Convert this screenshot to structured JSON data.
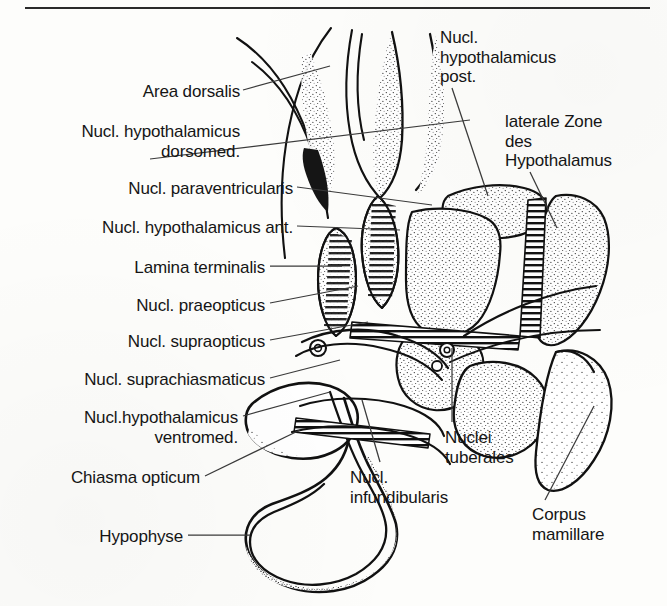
{
  "figure": {
    "title": "Hypothalamus",
    "language": "de",
    "top_rule": true,
    "background_color": "#fdfdfb",
    "ink_color": "#151515"
  },
  "labels": [
    {
      "id": "area-dorsalis",
      "text": "Area dorsalis",
      "lines": [
        "Area dorsalis"
      ],
      "align": "right",
      "x": 10,
      "y": 82,
      "w": 230
    },
    {
      "id": "nucl-hypo-dorsomed",
      "text": "Nucl. hypothalamicus dorsomed.",
      "lines": [
        "Nucl. hypothalamicus",
        "dorsomed."
      ],
      "align": "right",
      "x": 10,
      "y": 122,
      "w": 230
    },
    {
      "id": "nucl-paraventricularis",
      "text": "Nucl. paraventricularis",
      "lines": [
        "Nucl. paraventricularis"
      ],
      "align": "right",
      "x": 10,
      "y": 179,
      "w": 283
    },
    {
      "id": "nucl-hypo-ant",
      "text": "Nucl. hypothalamicus ant.",
      "lines": [
        "Nucl. hypothalamicus ant."
      ],
      "align": "right",
      "x": 10,
      "y": 218,
      "w": 283
    },
    {
      "id": "lamina-terminalis",
      "text": "Lamina terminalis",
      "lines": [
        "Lamina terminalis"
      ],
      "align": "right",
      "x": 10,
      "y": 258,
      "w": 255
    },
    {
      "id": "nucl-praeopticus",
      "text": "Nucl. praeopticus",
      "lines": [
        "Nucl. praeopticus"
      ],
      "align": "right",
      "x": 10,
      "y": 296,
      "w": 255
    },
    {
      "id": "nucl-supraopticus",
      "text": "Nucl. supraopticus",
      "lines": [
        "Nucl. supraopticus"
      ],
      "align": "right",
      "x": 10,
      "y": 332,
      "w": 255
    },
    {
      "id": "nucl-suprachiasmaticus",
      "text": "Nucl. suprachiasmaticus",
      "lines": [
        "Nucl. suprachiasmaticus"
      ],
      "align": "right",
      "x": 10,
      "y": 370,
      "w": 255
    },
    {
      "id": "nucl-hypo-ventromed",
      "text": "Nucl. hypothalamicus ventromed.",
      "lines": [
        "Nucl.hypothalamicus",
        "ventromed."
      ],
      "align": "right",
      "x": 10,
      "y": 408,
      "w": 228
    },
    {
      "id": "chiasma-opticum",
      "text": "Chiasma opticum",
      "lines": [
        "Chiasma opticum"
      ],
      "align": "right",
      "x": 10,
      "y": 468,
      "w": 190
    },
    {
      "id": "hypophyse",
      "text": "Hypophyse",
      "lines": [
        "Hypophyse"
      ],
      "align": "right",
      "x": 10,
      "y": 527,
      "w": 173
    },
    {
      "id": "nucl-hypo-post",
      "text": "Nucl. hypothalamicus post.",
      "lines": [
        "Nucl.",
        "hypothalamicus",
        "post."
      ],
      "align": "left",
      "x": 440,
      "y": 28,
      "w": 200
    },
    {
      "id": "laterale-zone",
      "text": "laterale Zone des Hypothalamus",
      "lines": [
        "laterale Zone",
        "des",
        "Hypothalamus"
      ],
      "align": "left",
      "x": 505,
      "y": 112,
      "w": 160
    },
    {
      "id": "nuclei-tuberales",
      "text": "Nuclei tuberales",
      "lines": [
        "Nuclei",
        "tuberales"
      ],
      "align": "left",
      "x": 445,
      "y": 428,
      "w": 130
    },
    {
      "id": "nucl-infundibularis",
      "text": "Nucl. infundibularis",
      "lines": [
        "Nucl.",
        "infundibularis"
      ],
      "align": "left",
      "x": 350,
      "y": 468,
      "w": 145
    },
    {
      "id": "corpus-mamillare",
      "text": "Corpus mamillare",
      "lines": [
        "Corpus",
        "mamillare"
      ],
      "align": "left",
      "x": 532,
      "y": 505,
      "w": 135
    }
  ],
  "leaders": [
    {
      "id": "leader-area-dorsalis",
      "from": [
        243,
        90
      ],
      "to": [
        330,
        66
      ]
    },
    {
      "id": "leader-nucl-hypo-dorsomed",
      "from": [
        150,
        159
      ],
      "to": [
        470,
        120
      ]
    },
    {
      "id": "leader-nucl-paraventricularis",
      "from": [
        297,
        187
      ],
      "to": [
        432,
        205
      ]
    },
    {
      "id": "leader-nucl-hypo-ant",
      "from": [
        297,
        226
      ],
      "to": [
        400,
        230
      ]
    },
    {
      "id": "leader-lamina-terminalis",
      "from": [
        270,
        266
      ],
      "to": [
        342,
        266
      ]
    },
    {
      "id": "leader-nucl-praeopticus",
      "from": [
        270,
        303
      ],
      "to": [
        358,
        286
      ]
    },
    {
      "id": "leader-nucl-supraopticus",
      "from": [
        270,
        340
      ],
      "to": [
        368,
        322
      ]
    },
    {
      "id": "leader-nucl-suprachiasmaticus",
      "from": [
        270,
        378
      ],
      "to": [
        340,
        360
      ]
    },
    {
      "id": "leader-nucl-hypo-ventromed",
      "from": [
        243,
        416
      ],
      "to": [
        330,
        392
      ]
    },
    {
      "id": "leader-chiasma-opticum",
      "from": [
        205,
        476
      ],
      "to": [
        300,
        430
      ]
    },
    {
      "id": "leader-hypophyse",
      "from": [
        188,
        535
      ],
      "to": [
        250,
        535
      ]
    },
    {
      "id": "leader-nucl-hypo-post",
      "from": [
        452,
        88
      ],
      "to": [
        488,
        196
      ]
    },
    {
      "id": "leader-laterale-zone",
      "from": [
        530,
        172
      ],
      "to": [
        557,
        228
      ]
    },
    {
      "id": "leader-nuclei-tuberales",
      "from": [
        452,
        422
      ],
      "to": [
        452,
        348
      ]
    },
    {
      "id": "leader-nucl-infundibularis",
      "from": [
        380,
        462
      ],
      "to": [
        362,
        400
      ]
    },
    {
      "id": "leader-corpus-mamillare",
      "from": [
        545,
        500
      ],
      "to": [
        594,
        406
      ]
    }
  ]
}
